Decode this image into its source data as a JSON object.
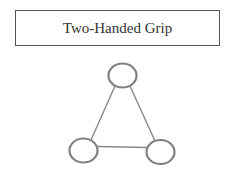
{
  "title": "Two-Handed Grip",
  "colors": {
    "stroke": "#808080",
    "border": "#555555",
    "text": "#333333",
    "background": "#ffffff"
  },
  "diagram": {
    "nodes": [
      {
        "id": "top",
        "cx": 122.5,
        "cy": 75.5,
        "rx": 14,
        "ry": 12
      },
      {
        "id": "bottom-left",
        "cx": 83.5,
        "cy": 150.5,
        "rx": 14,
        "ry": 12
      },
      {
        "id": "bottom-right",
        "cx": 160.5,
        "cy": 152,
        "rx": 14,
        "ry": 12
      }
    ],
    "edges": [
      {
        "from": "top",
        "to": "bottom-left"
      },
      {
        "from": "top",
        "to": "bottom-right"
      },
      {
        "from": "bottom-left",
        "to": "bottom-right"
      }
    ]
  }
}
